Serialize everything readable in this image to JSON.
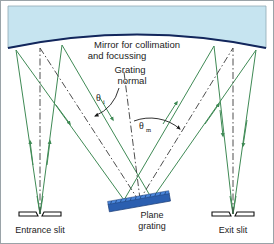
{
  "figure": {
    "type": "optical-ray-diagram",
    "canvas": {
      "width": 274,
      "height": 244
    },
    "background_color": "#ffffff",
    "border_color": "#9aa3a8"
  },
  "labels": {
    "mirror_line1": "Mirror for collimation",
    "mirror_line2": "and focussing",
    "grating_normal_line1": "Grating",
    "grating_normal_line2": "normal",
    "entrance_slit": "Entrance slit",
    "plane_grating_line1": "Plane",
    "plane_grating_line2": "grating",
    "exit_slit": "Exit slit",
    "angle_incident": "θ",
    "angle_incident_sub": "i",
    "angle_diffracted": "θ",
    "angle_diffracted_sub": "m"
  },
  "colors": {
    "mirror_fill": "#c6e4f0",
    "mirror_edge": "#12265c",
    "mirror_top_edge": "#6d8fa0",
    "ray_green": "#3f8a55",
    "grating_body": "#2b5fb0",
    "grating_top": "#3f79cf",
    "grating_grooves": "#1b3d78",
    "axis_dashdot": "#3a3a3a",
    "slit_jaw": "#111111",
    "text": "#1b1b1b"
  },
  "components": [
    {
      "name": "concave-mirror",
      "role": "collimating and focussing mirror",
      "shape": "curved-top-block"
    },
    {
      "name": "plane-grating",
      "role": "dispersing element",
      "shape": "tilted-slab"
    },
    {
      "name": "entrance-slit",
      "role": "source aperture",
      "shape": "paired-jaws"
    },
    {
      "name": "exit-slit",
      "role": "detector aperture",
      "shape": "paired-jaws"
    }
  ],
  "geometry": {
    "mirror_chord_left_x": 8,
    "mirror_chord_right_x": 266,
    "mirror_sag_y": 34,
    "mirror_edge_y": 57,
    "grating_center": {
      "x": 139,
      "y": 201
    },
    "grating_tilt_deg": -10,
    "entrance_slit": {
      "x": 40,
      "y": 214
    },
    "exit_slit": {
      "x": 233,
      "y": 214
    },
    "normal_top": {
      "x": 124,
      "y": 72
    },
    "normal_bottom": {
      "x": 140,
      "y": 199
    }
  }
}
